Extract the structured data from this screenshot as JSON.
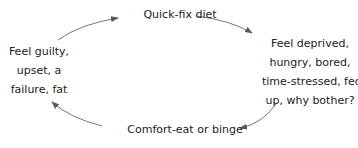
{
  "diagram": {
    "type": "cycle",
    "nodes": [
      {
        "id": "top",
        "lines": [
          "Quick-fix diet"
        ]
      },
      {
        "id": "right",
        "lines": [
          "Feel deprived,",
          "hungry, bored,",
          "time-stressed, fed",
          "up, why bother?"
        ]
      },
      {
        "id": "bottom",
        "lines": [
          "Comfort-eat or binge"
        ]
      },
      {
        "id": "left",
        "lines": [
          "Feel guilty,",
          "upset, a",
          "failure, fat"
        ]
      }
    ],
    "edges": [
      {
        "from": "top",
        "to": "right"
      },
      {
        "from": "right",
        "to": "bottom"
      },
      {
        "from": "bottom",
        "to": "left"
      },
      {
        "from": "left",
        "to": "top"
      }
    ],
    "colors": {
      "text": "#222222",
      "arrow": "#6b6b6b"
    }
  }
}
